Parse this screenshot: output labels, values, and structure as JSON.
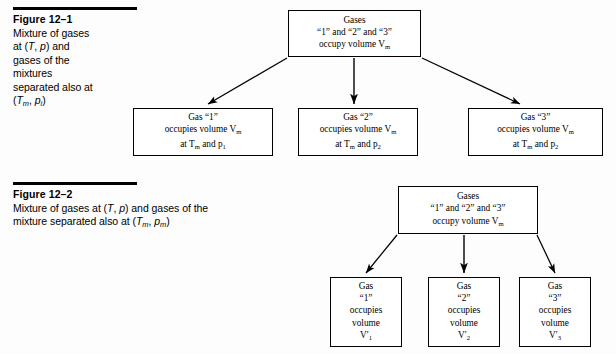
{
  "figures": [
    {
      "id": "figure-12-1",
      "label": "Figure 12–1",
      "caption_lines": [
        "Mixture of gases",
        "at (T, p) and",
        "gases of the",
        "mixtures",
        "separated also at",
        "(Tₘ, pᵢ)"
      ],
      "caption_text": "Mixture of gases at (T, p) and gases of the mixtures separated also at (Tm, pi)",
      "top_box": {
        "line1": "Gases",
        "line2": "“1” and “2” and “3”",
        "line3": "occupy volume Vₘ"
      },
      "boxes": [
        {
          "line1": "Gas “1”",
          "line2": "occupies volume Vₘ",
          "line3": "at Tₘ and p₁"
        },
        {
          "line1": "Gas “2”",
          "line2": "occupies volume Vₘ",
          "line3": "at Tₘ and p₂"
        },
        {
          "line1": "Gas “3”",
          "line2": "occupies volume Vₘ",
          "line3": "at Tₘ and p₂"
        }
      ]
    },
    {
      "id": "figure-12-2",
      "label": "Figure 12–2",
      "caption_lines": [
        "Mixture of gases at (T, p) and gases of the",
        "mixture separated also at (Tₘ, pₘ)"
      ],
      "caption_text": "Mixture of gases at (T, p) and gases of the mixture separated also at (Tm, pm)",
      "top_box": {
        "line1": "Gases",
        "line2": "“1” and “2” and “3”",
        "line3": "occupy volume Vₘ"
      },
      "boxes": [
        {
          "line1": "Gas",
          "line2": "“1”",
          "line3": "occupies",
          "line4": "volume",
          "line5": "V′₁"
        },
        {
          "line1": "Gas",
          "line2": "“2”",
          "line3": "occupies",
          "line4": "volume",
          "line5": "V′₂"
        },
        {
          "line1": "Gas",
          "line2": "“3”",
          "line3": "occupies",
          "line4": "volume",
          "line5": "V′₃"
        }
      ]
    }
  ],
  "colors": {
    "ink": "#000000",
    "page": "#fdfdfd",
    "box_border": "#000000"
  }
}
